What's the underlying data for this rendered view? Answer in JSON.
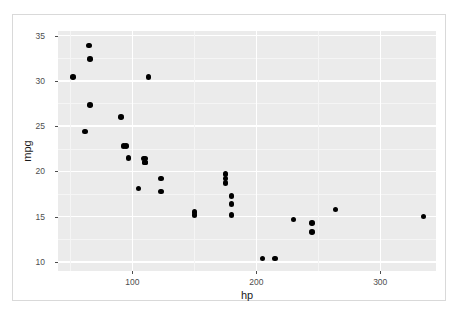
{
  "chart_data": {
    "type": "scatter",
    "title": "",
    "xlabel": "hp",
    "ylabel": "mpg",
    "xlim": [
      40,
      345
    ],
    "ylim": [
      9.0,
      35.5
    ],
    "xticks": [
      100,
      200,
      300
    ],
    "yticks": [
      10,
      15,
      20,
      25,
      30,
      35
    ],
    "grid": true,
    "legend": "none",
    "panel_background": "#ebebeb",
    "gridline_color": "#ffffff",
    "point_color": "#000000",
    "x": [
      110,
      110,
      93,
      110,
      175,
      105,
      245,
      62,
      95,
      123,
      123,
      180,
      180,
      180,
      205,
      215,
      230,
      66,
      52,
      65,
      97,
      150,
      150,
      245,
      175,
      66,
      91,
      113,
      264,
      175,
      335,
      109
    ],
    "y": [
      21.0,
      21.0,
      22.8,
      21.4,
      18.7,
      18.1,
      14.3,
      24.4,
      22.8,
      19.2,
      17.8,
      16.4,
      17.3,
      15.2,
      10.4,
      10.4,
      14.7,
      32.4,
      30.4,
      33.9,
      21.5,
      15.5,
      15.2,
      13.3,
      19.2,
      27.3,
      26.0,
      30.4,
      15.8,
      19.7,
      15.0,
      21.4
    ]
  },
  "axis": {
    "y_tick_labels": [
      "35",
      "30",
      "25",
      "20",
      "15",
      "10"
    ],
    "x_tick_labels": [
      "100",
      "200",
      "300"
    ],
    "x_title": "hp",
    "y_title": "mpg"
  }
}
